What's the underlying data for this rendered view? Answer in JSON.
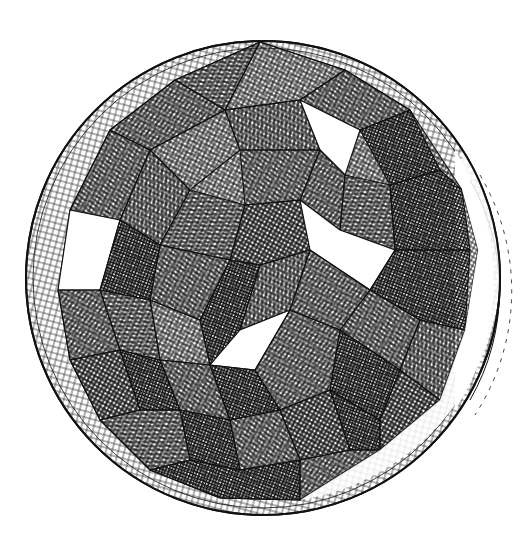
{
  "image": {
    "subject": "engraving of a faceted polyhedron inscribed in a sphere",
    "width": 525,
    "height": 541,
    "background": "#ffffff",
    "ink": "#111111",
    "sphere": {
      "cx": 263,
      "cy": 278,
      "r": 237
    },
    "text": []
  }
}
